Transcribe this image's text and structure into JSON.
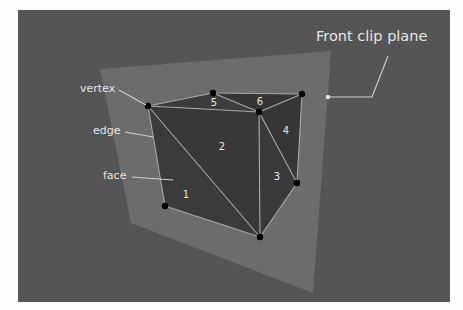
{
  "diagram": {
    "title_label": "Front clip plane",
    "labels": {
      "vertex": "vertex",
      "edge": "edge",
      "face": "face"
    },
    "face_numbers": [
      "1",
      "2",
      "3",
      "4",
      "5",
      "6"
    ],
    "colors": {
      "background": "#555555",
      "clip_plane": "#6c6c6c",
      "cube_face": "#3b3b3b",
      "edge_line": "#a8a8a8",
      "vertex_dot": "#000000",
      "label_text": "#e6e6e6"
    }
  }
}
